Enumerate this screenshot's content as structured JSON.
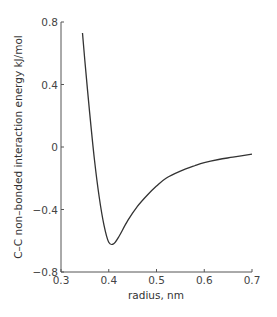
{
  "chart_data": {
    "type": "line",
    "title": "",
    "xlabel": "radius, nm",
    "ylabel": "C–C non–bonded interaction energy kJ/mol",
    "xlim": [
      0.3,
      0.7
    ],
    "ylim": [
      -0.8,
      0.8
    ],
    "xticks": [
      "0.3",
      "0.4",
      "0.5",
      "0.6",
      "0.7"
    ],
    "yticks": [
      "0.8",
      "0.4",
      "0",
      "−0.4",
      "−0.8"
    ],
    "grid": false,
    "legend": null,
    "series": [
      {
        "name": "C-C Lennard-Jones potential",
        "x": [
          0.345,
          0.35,
          0.36,
          0.37,
          0.38,
          0.39,
          0.4,
          0.41,
          0.42,
          0.44,
          0.46,
          0.48,
          0.5,
          0.52,
          0.55,
          0.58,
          0.6,
          0.63,
          0.66,
          0.7
        ],
        "values": [
          0.73,
          0.55,
          0.22,
          -0.08,
          -0.32,
          -0.5,
          -0.61,
          -0.62,
          -0.58,
          -0.47,
          -0.38,
          -0.31,
          -0.25,
          -0.2,
          -0.155,
          -0.12,
          -0.1,
          -0.08,
          -0.065,
          -0.045
        ]
      }
    ]
  },
  "colors": {
    "curve": "#333333",
    "axis": "#555555",
    "background": "#ffffff"
  }
}
